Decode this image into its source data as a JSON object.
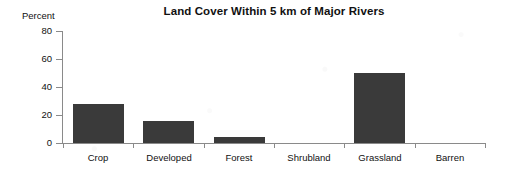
{
  "chart_data": {
    "type": "bar",
    "title": "Land Cover Within 5 km of Major Rivers",
    "xlabel": "",
    "ylabel": "Percent",
    "categories": [
      "Crop",
      "Developed",
      "Forest",
      "Shrubland",
      "Grassland",
      "Barren"
    ],
    "values": [
      28,
      16,
      4,
      0,
      50,
      0
    ],
    "ylim": [
      0,
      80
    ],
    "yticks": [
      0,
      20,
      40,
      60,
      80
    ],
    "ytick_labels": [
      "0",
      "20",
      "40",
      "60",
      "80"
    ],
    "grid": false,
    "legend": "none",
    "bar_color": "#3a3a3a",
    "axis_color": "#8a8a8a",
    "background_color": "#ffffff"
  },
  "axes": {
    "y_title": "Percent"
  }
}
